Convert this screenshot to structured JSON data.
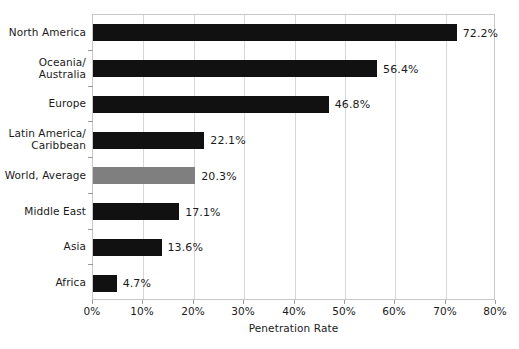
{
  "chart_data": {
    "type": "bar",
    "orientation": "horizontal",
    "title": "",
    "xlabel": "Penetration Rate",
    "ylabel": "",
    "xlim": [
      0,
      80
    ],
    "grid": true,
    "legend": false,
    "xtick_labels": [
      "0%",
      "10%",
      "20%",
      "30%",
      "40%",
      "50%",
      "60%",
      "70%",
      "80%"
    ],
    "xtick_values": [
      0,
      10,
      20,
      30,
      40,
      50,
      60,
      70,
      80
    ],
    "categories": [
      "North America",
      "Oceania/\nAustralia",
      "Europe",
      "Latin America/\nCaribbean",
      "World, Average",
      "Middle East",
      "Asia",
      "Africa"
    ],
    "values": [
      72.2,
      56.4,
      46.8,
      22.1,
      20.3,
      17.1,
      13.6,
      4.7
    ],
    "value_labels": [
      "72.2%",
      "56.4%",
      "46.8%",
      "22.1%",
      "20.3%",
      "17.1%",
      "13.6%",
      "4.7%"
    ],
    "bar_colors": [
      "#111111",
      "#111111",
      "#111111",
      "#111111",
      "#7f7f7f",
      "#111111",
      "#111111",
      "#111111"
    ],
    "highlight_category": "World, Average",
    "colors": {
      "bar": "#111111",
      "highlight_bar": "#7f7f7f",
      "gridline": "#d6d6d6",
      "axis": "#c8c8c8",
      "text": "#1a1a1a",
      "background": "#ffffff"
    }
  }
}
